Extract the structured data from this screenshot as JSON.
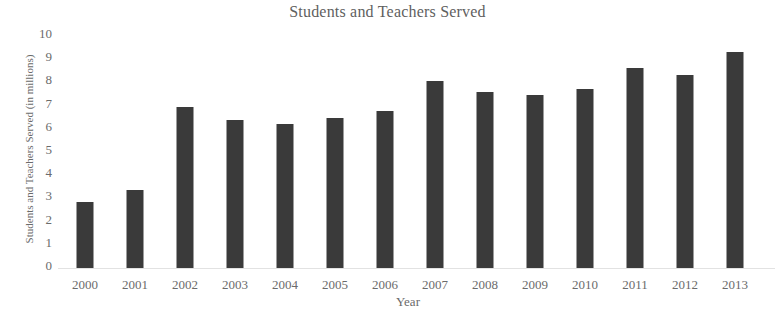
{
  "chart_data": {
    "type": "bar",
    "title": "Students and Teachers Served",
    "xlabel": "Year",
    "ylabel": "Students and Teachers Served (in millions)",
    "categories": [
      "2000",
      "2001",
      "2002",
      "2003",
      "2004",
      "2005",
      "2006",
      "2007",
      "2008",
      "2009",
      "2010",
      "2011",
      "2012",
      "2013"
    ],
    "values": [
      2.85,
      3.35,
      6.95,
      6.4,
      6.2,
      6.45,
      6.75,
      8.05,
      7.6,
      7.45,
      7.7,
      8.6,
      8.3,
      9.3
    ],
    "ylim": [
      0,
      10
    ],
    "ytick_labels": [
      "10",
      "9",
      "8",
      "7",
      "6",
      "5",
      "4",
      "3",
      "2",
      "1",
      "0"
    ],
    "ytick_values": [
      10,
      9,
      8,
      7,
      6,
      5,
      4,
      3,
      2,
      1,
      0
    ],
    "grid": false,
    "legend": false,
    "legend_position": "none",
    "bar_color": "#3a3a3a",
    "text_color": "#6b6b6b",
    "background_color": "#ffffff"
  }
}
